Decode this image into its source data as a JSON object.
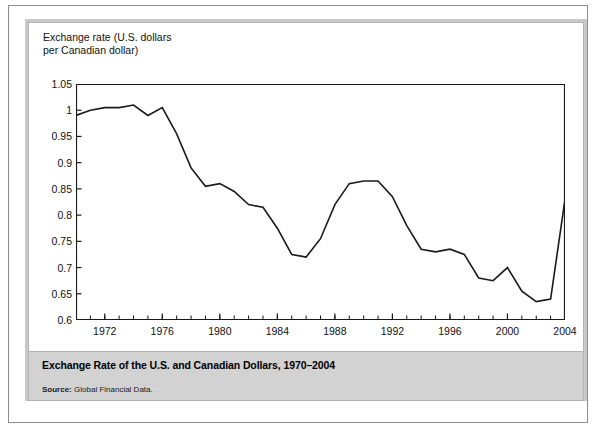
{
  "figure": {
    "axis_caption": "Exchange rate (U.S. dollars\nper Canadian dollar)",
    "title": "Exchange Rate of the U.S. and Canadian Dollars, 1970–2004",
    "source_label": "Source:",
    "source_value": "Global Financial Data."
  },
  "colors": {
    "line": "#1a1a1a",
    "axis": "#1a1a1a",
    "caption_band": "#d2d2d2",
    "mat": "#c9c9c9",
    "page": "#ffffff"
  },
  "chart_data": {
    "type": "line",
    "title": "Exchange Rate of the U.S. and Canadian Dollars, 1970–2004",
    "xlabel": "",
    "ylabel": "Exchange rate (U.S. dollars per Canadian dollar)",
    "xlim": [
      1970,
      2004
    ],
    "ylim": [
      0.6,
      1.05
    ],
    "ytick_values": [
      0.6,
      0.65,
      0.7,
      0.75,
      0.8,
      0.85,
      0.9,
      0.95,
      1,
      1.05
    ],
    "ytick_labels": [
      "0.6",
      "0.65",
      "0.7",
      "0.75",
      "0.8",
      "0.85",
      "0.9",
      "0.95",
      "1",
      "1.05"
    ],
    "xtick_values": [
      1972,
      1976,
      1980,
      1984,
      1988,
      1992,
      1996,
      2000,
      2004
    ],
    "xtick_labels": [
      "1972",
      "1976",
      "1980",
      "1984",
      "1988",
      "1992",
      "1996",
      "2000",
      "2004"
    ],
    "minor_xticks_every": 1,
    "grid": false,
    "legend": "none",
    "series": [
      {
        "name": "U.S. dollars per Canadian dollar",
        "x": [
          1970,
          1971,
          1972,
          1973,
          1974,
          1975,
          1976,
          1977,
          1978,
          1979,
          1980,
          1981,
          1982,
          1983,
          1984,
          1985,
          1986,
          1987,
          1988,
          1989,
          1990,
          1991,
          1992,
          1993,
          1994,
          1995,
          1996,
          1997,
          1998,
          1999,
          2000,
          2001,
          2002,
          2003,
          2004
        ],
        "values": [
          0.99,
          1.0,
          1.005,
          1.005,
          1.01,
          0.99,
          1.005,
          0.955,
          0.89,
          0.855,
          0.86,
          0.845,
          0.82,
          0.815,
          0.775,
          0.725,
          0.72,
          0.755,
          0.82,
          0.86,
          0.865,
          0.865,
          0.835,
          0.78,
          0.735,
          0.73,
          0.735,
          0.725,
          0.68,
          0.675,
          0.7,
          0.655,
          0.635,
          0.64,
          0.83
        ]
      }
    ]
  }
}
